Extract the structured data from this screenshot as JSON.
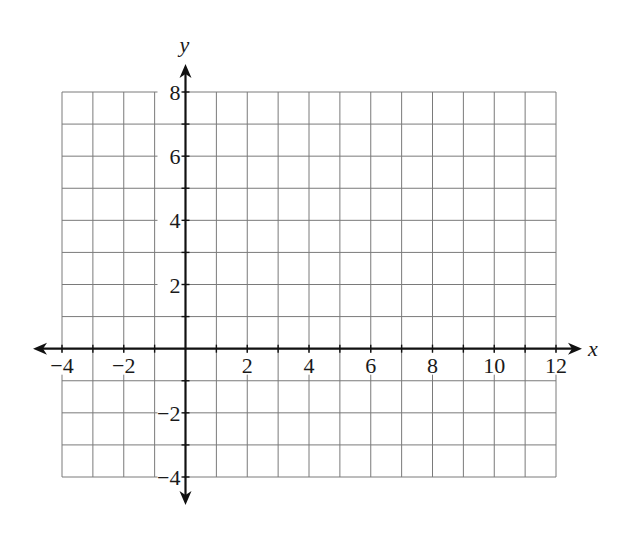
{
  "chart_data": {
    "type": "line",
    "title": "",
    "xlabel": "x",
    "ylabel": "y",
    "xlim": [
      -4,
      12
    ],
    "ylim": [
      -4,
      8
    ],
    "grid": true,
    "grid_step": 1,
    "x_ticks": [
      -4,
      -2,
      2,
      4,
      6,
      8,
      10,
      12
    ],
    "x_tick_labels": [
      "−4",
      "−2",
      "2",
      "4",
      "6",
      "8",
      "10",
      "12"
    ],
    "y_ticks": [
      8,
      6,
      4,
      2,
      -2,
      -4
    ],
    "y_tick_labels": [
      "8",
      "6",
      "4",
      "2",
      "−2",
      "−4"
    ],
    "series": [],
    "legend": null,
    "axes_arrows": true
  },
  "layout": {
    "origin_px": [
      186,
      348
    ],
    "grid_left_px": 62,
    "grid_right_px": 556,
    "grid_top_px": 92,
    "grid_bottom_px": 477,
    "x_axis_arrow_left_px": 33,
    "x_axis_arrow_right_px": 582,
    "y_axis_arrow_top_px": 64,
    "y_axis_arrow_bottom_px": 505,
    "colors": {
      "grid": "#7a7a7a",
      "axis": "#111111",
      "text": "#1a1a1a"
    }
  }
}
